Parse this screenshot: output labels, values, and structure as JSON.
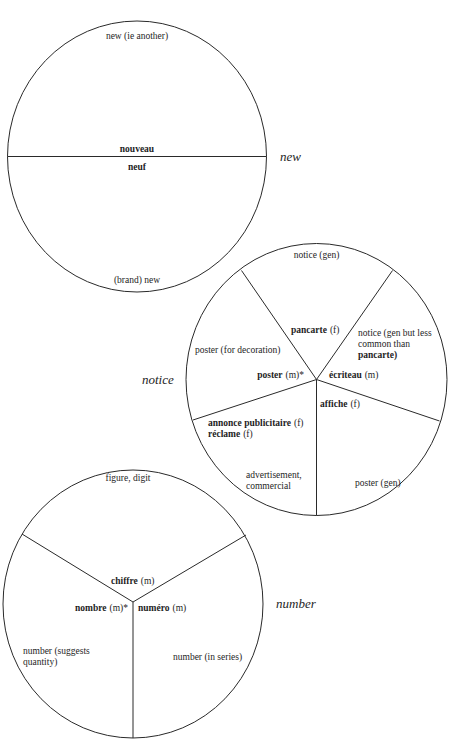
{
  "diagrams": [
    {
      "name": "new",
      "side_label": "new",
      "segments": [
        {
          "gloss": "new (ie another)",
          "term": "nouveau"
        },
        {
          "gloss": "(brand) new",
          "term": "neuf"
        }
      ]
    },
    {
      "name": "notice",
      "side_label": "notice",
      "segments": [
        {
          "gloss": "notice (gen)",
          "term": "pancarte",
          "gender": "(f)"
        },
        {
          "gloss_lines": [
            "notice (gen but less",
            "common than",
            "pancarte)"
          ],
          "term": "écriteau",
          "gender": "(m)"
        },
        {
          "gloss": "poster (gen)",
          "term": "affiche",
          "gender": "(f)"
        },
        {
          "gloss_lines": [
            "advertisement,",
            "commercial"
          ],
          "term_lines": [
            "annonce publicitaire",
            "réclame"
          ],
          "gender_lines": [
            "(f)",
            "(f)"
          ]
        },
        {
          "gloss": "poster (for decoration)",
          "term": "poster",
          "gender": "(m)*"
        }
      ]
    },
    {
      "name": "number",
      "side_label": "number",
      "segments": [
        {
          "gloss": "figure, digit",
          "term": "chiffre",
          "gender": "(m)"
        },
        {
          "gloss": "number (in series)",
          "term": "numéro",
          "gender": "(m)"
        },
        {
          "gloss_lines": [
            "number (suggests",
            "quantity)"
          ],
          "term": "nombre",
          "gender": "(m)*"
        }
      ]
    }
  ],
  "colors": {
    "background": "#ffffff",
    "line": "#2a2a2a",
    "text": "#1e1e1e"
  }
}
